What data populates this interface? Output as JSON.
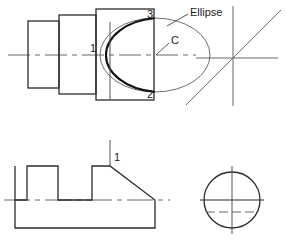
{
  "drawing": {
    "type": "orthographic-engineering-drawing",
    "canvas": {
      "width": 286,
      "height": 244,
      "background": "#ffffff"
    },
    "line_colors": {
      "object": "#2b2b2b",
      "thin": "#555555",
      "center": "#666666",
      "bold_arc": "#111111"
    },
    "labels": {
      "point_1_top": "1",
      "point_2": "2",
      "point_3": "3",
      "center_c": "C",
      "ellipse_callout": "Ellipse",
      "point_1_front": "1"
    },
    "top_view": {
      "name": "stepped-cylinder-with-ellipse",
      "steps": [
        {
          "name": "step-small",
          "x": 28,
          "y": 21,
          "w": 31,
          "h": 67
        },
        {
          "name": "step-medium",
          "x": 59,
          "y": 15,
          "w": 37,
          "h": 79
        },
        {
          "name": "step-large",
          "x": 96,
          "y": 9,
          "w": 58,
          "h": 91
        }
      ],
      "ellipse": {
        "cx": 155,
        "cy": 55,
        "rx": 55,
        "ry": 37
      },
      "centerline_y": 55,
      "vertical_projection_x": 110
    },
    "front_view": {
      "name": "notched-block-with-chamfer",
      "outline": "15,166 15,200 27,200 27,166 58,166 58,200 92,200 92,166 110,166 155,200 155,228 15,228",
      "centerline_y": 200
    },
    "side_view": {
      "name": "circle-view",
      "circle": {
        "cx": 232,
        "cy": 200,
        "r": 28
      },
      "hidden_line_y": 212
    },
    "axes_marker": {
      "name": "axis-cross-with-diagonal",
      "cx": 233,
      "cy": 58,
      "diagonal_angle_deg": 45
    }
  }
}
